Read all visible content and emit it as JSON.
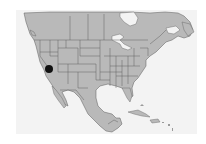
{
  "map": {
    "region": "North America",
    "colors": {
      "page_background": "#ffffff",
      "water": "#f3f3f3",
      "land": "#b9b9b9",
      "border": "#5a5a5a",
      "marker": "#111111"
    },
    "marker": {
      "label": "location-marker",
      "x": 49,
      "y": 69,
      "radius": 4
    }
  }
}
